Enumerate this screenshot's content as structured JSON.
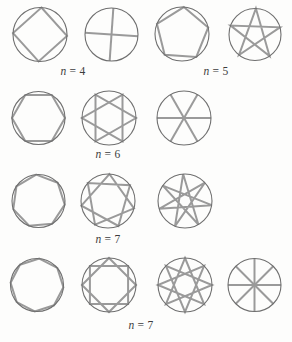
{
  "figure": {
    "canvas": {
      "width": 292,
      "height": 342,
      "background": "#fdfdfc"
    },
    "style": {
      "circle_color": "#6f6f6f",
      "circle_stroke_width": 1.1,
      "shape_color": "#9a9a9a",
      "shape_stroke_width": 2,
      "label_color": "#3c3c3c"
    },
    "circles": [
      {
        "name": "n4-polygon",
        "cx": 40,
        "cy": 34.5,
        "r": 27,
        "polygon": {
          "n": 4,
          "k": 1,
          "start_deg": -87
        }
      },
      {
        "name": "n4-star-2",
        "cx": 111.5,
        "cy": 34.5,
        "r": 26.5,
        "polygon": {
          "n": 4,
          "k": 2,
          "start_deg": -86
        }
      },
      {
        "name": "n5-polygon",
        "cx": 182,
        "cy": 34,
        "r": 27,
        "polygon": {
          "n": 5,
          "k": 1,
          "start_deg": -86
        }
      },
      {
        "name": "n5-star-2",
        "cx": 255,
        "cy": 34.5,
        "r": 26,
        "polygon": {
          "n": 5,
          "k": 2,
          "start_deg": -88
        }
      },
      {
        "name": "n6-polygon",
        "cx": 38.5,
        "cy": 118,
        "r": 26.5,
        "polygon": {
          "n": 6,
          "k": 1,
          "start_deg": 0
        }
      },
      {
        "name": "n6-star-2",
        "cx": 109,
        "cy": 118,
        "r": 27,
        "polygon": {
          "n": 6,
          "k": 2,
          "start_deg": 0
        }
      },
      {
        "name": "n6-star-3",
        "cx": 184,
        "cy": 118,
        "r": 27,
        "polygon": {
          "n": 6,
          "k": 3,
          "start_deg": 0
        }
      },
      {
        "name": "n7-polygon",
        "cx": 38.5,
        "cy": 201,
        "r": 26.5,
        "polygon": {
          "n": 7,
          "k": 1,
          "start_deg": -95
        }
      },
      {
        "name": "n7-star-2",
        "cx": 108,
        "cy": 201,
        "r": 27,
        "polygon": {
          "n": 7,
          "k": 2,
          "start_deg": -87
        }
      },
      {
        "name": "n7-star-3",
        "cx": 185,
        "cy": 201,
        "r": 27,
        "polygon": {
          "n": 7,
          "k": 3,
          "start_deg": -94
        }
      },
      {
        "name": "n8-polygon",
        "cx": 37,
        "cy": 285,
        "r": 26.5,
        "polygon": {
          "n": 8,
          "k": 1,
          "start_deg": -85
        }
      },
      {
        "name": "n8-star-2",
        "cx": 109,
        "cy": 285,
        "r": 27,
        "polygon": {
          "n": 8,
          "k": 2,
          "start_deg": -90
        }
      },
      {
        "name": "n8-star-3",
        "cx": 185,
        "cy": 285,
        "r": 27,
        "polygon": {
          "n": 8,
          "k": 3,
          "start_deg": -90
        }
      },
      {
        "name": "n8-star-4",
        "cx": 254.5,
        "cy": 285,
        "r": 26.5,
        "polygon": {
          "n": 8,
          "k": 4,
          "start_deg": -90
        }
      }
    ],
    "labels": [
      {
        "var": "n",
        "rest": " = 4",
        "x": 73,
        "y": 70.5
      },
      {
        "var": "n",
        "rest": " = 5",
        "x": 216,
        "y": 70.5
      },
      {
        "var": "n",
        "rest": " = 6",
        "x": 108,
        "y": 153.5
      },
      {
        "var": "n",
        "rest": " = 7",
        "x": 108,
        "y": 239
      },
      {
        "var": "n",
        "rest": " = 7",
        "x": 141,
        "y": 324.5
      }
    ]
  }
}
